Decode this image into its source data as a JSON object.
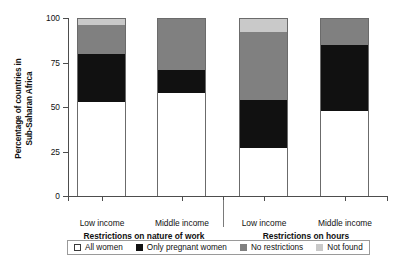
{
  "chart_data": {
    "type": "bar",
    "subtype": "stacked-bar",
    "title": "",
    "xlabel": "",
    "ylabel": "Percentage of countries in Sub-Saharan Africa",
    "ylim": [
      0,
      100
    ],
    "yticks": [
      0,
      25,
      50,
      75,
      100
    ],
    "ytick_labels": [
      "0",
      "25",
      "50",
      "75",
      "100"
    ],
    "grid": false,
    "legend_position": "bottom",
    "categories": [
      "Low income",
      "Middle income",
      "Low income",
      "Middle income"
    ],
    "groups": [
      {
        "label": "Restrictions on nature of work",
        "categories": [
          "Low income",
          "Middle income"
        ]
      },
      {
        "label": "Restrictions on hours",
        "categories": [
          "Low income",
          "Middle income"
        ]
      }
    ],
    "series": [
      {
        "name": "All women",
        "color": "#ffffff",
        "values": [
          53,
          58,
          27,
          48
        ]
      },
      {
        "name": "Only pregnant women",
        "color": "#111111",
        "values": [
          27,
          13,
          27,
          37
        ]
      },
      {
        "name": "No restrictions",
        "color": "#808080",
        "values": [
          16,
          29,
          38,
          15
        ]
      },
      {
        "name": "Not found",
        "color": "#c9c9c9",
        "values": [
          4,
          0,
          8,
          0
        ]
      }
    ]
  },
  "axis": {
    "y_title": "Percentage of countries in Sub-Saharan Africa",
    "y_title_line1": "Percentage of countries in",
    "y_title_line2": "Sub-Saharan Africa"
  },
  "legend": {
    "items": [
      {
        "label": "All women",
        "swatch": "swatch-white",
        "color": "#ffffff"
      },
      {
        "label": "Only pregnant women",
        "swatch": "swatch-black",
        "color": "#111111"
      },
      {
        "label": "No restrictions",
        "swatch": "swatch-darkgray",
        "color": "#808080"
      },
      {
        "label": "Not found",
        "swatch": "swatch-lightgray",
        "color": "#c9c9c9"
      }
    ]
  }
}
